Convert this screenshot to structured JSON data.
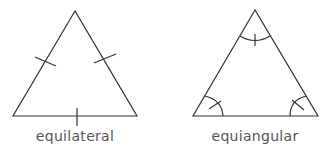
{
  "figures": [
    {
      "name": "equilateral",
      "label": "equilateral",
      "marking": "side tick marks"
    },
    {
      "name": "equiangular",
      "label": "equiangular",
      "marking": "angle arcs with ticks"
    }
  ],
  "colors": {
    "stroke": "#333333",
    "label": "#555555",
    "background": "#ffffff"
  }
}
